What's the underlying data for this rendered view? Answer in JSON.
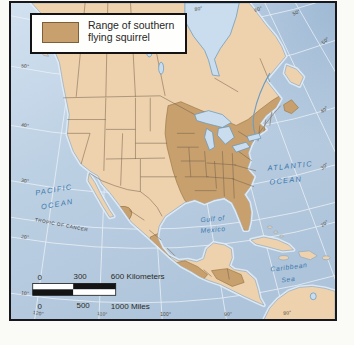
{
  "legend": {
    "line1": "Range of southern",
    "line2": "flying squirrel"
  },
  "sea_labels": {
    "pacific1": "PACIFIC",
    "pacific2": "OCEAN",
    "atlantic1": "ATLANTIC",
    "atlantic2": "OCEAN",
    "gulf1": "Gulf of",
    "gulf2": "Mexico",
    "carib1": "Caribbean",
    "carib2": "Sea",
    "tropic": "TROPIC OF CANCER"
  },
  "graticule": {
    "left": [
      "50°",
      "40°",
      "30°",
      "20°",
      "10°"
    ],
    "right": [
      "50°",
      "40°",
      "30°",
      "20°"
    ],
    "top": [
      "80°",
      "60°",
      "50°"
    ],
    "bottom": [
      "120°",
      "110°",
      "100°",
      "90°",
      "80°"
    ]
  },
  "scalebar": {
    "km_start": "0",
    "km_mid": "300",
    "km_end": "600 Kilometers",
    "mi_start": "0",
    "mi_mid": "500",
    "mi_end": "1000 Miles"
  },
  "colors": {
    "range": "#c7a06e",
    "land": "#eed2ae",
    "ocean": "#bed2e4"
  }
}
